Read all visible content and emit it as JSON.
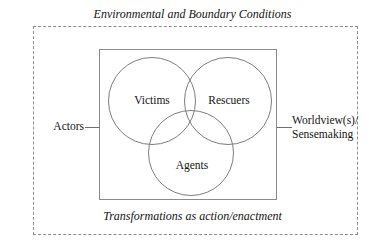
{
  "diagram": {
    "top_caption": "Environmental and Boundary Conditions",
    "bottom_caption": "Transformations as action/enactment",
    "left_label": "Actors",
    "right_label_line1": "Worldview(s)/",
    "right_label_line2": "Sensemaking",
    "venn": {
      "sets": [
        {
          "id": "victims",
          "label": "Victims"
        },
        {
          "id": "rescuers",
          "label": "Rescuers"
        },
        {
          "id": "agents",
          "label": "Agents"
        }
      ]
    },
    "colors": {
      "stroke": "#7d7d7d",
      "dashed_border": "#8d8d8d",
      "box_border": "#8a8a8a",
      "text": "#141414",
      "background": "#ffffff"
    }
  }
}
